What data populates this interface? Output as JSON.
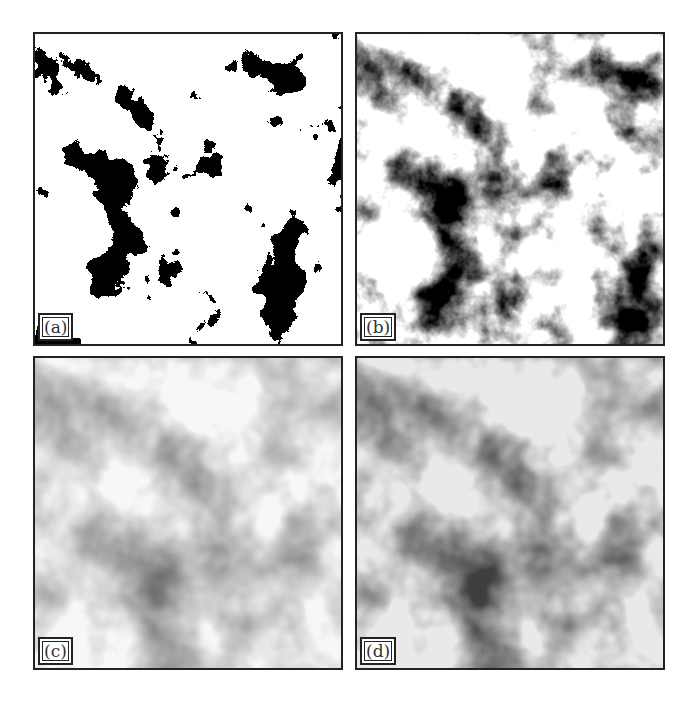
{
  "figure": {
    "panels": [
      {
        "id": "a",
        "label": "(a)",
        "style": "binary-thresholded cluster field"
      },
      {
        "id": "b",
        "label": "(b)",
        "style": "high-contrast grayscale cluster field"
      },
      {
        "id": "c",
        "label": "(c)",
        "style": "low-contrast smoothed grayscale field"
      },
      {
        "id": "d",
        "label": "(d)",
        "style": "medium-contrast smoothed grayscale field"
      }
    ]
  }
}
